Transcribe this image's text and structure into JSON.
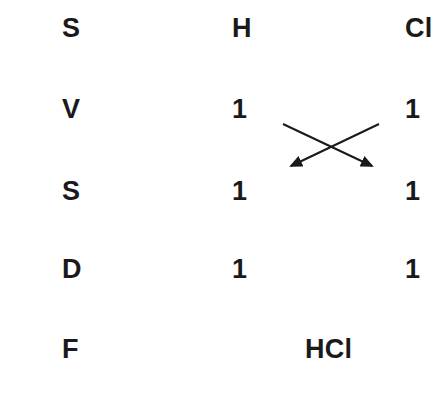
{
  "diagram": {
    "background_color": "#ffffff",
    "text_color": "#1a1a1a",
    "rows": [
      {
        "key": "symbol",
        "label": "S",
        "first": "H",
        "second": "Cl"
      },
      {
        "key": "valency",
        "label": "V",
        "first": "1",
        "second": "1"
      },
      {
        "key": "swap",
        "label": "S",
        "first": "1",
        "second": "1"
      },
      {
        "key": "divide",
        "label": "D",
        "first": "1",
        "second": "1"
      },
      {
        "key": "formula",
        "label": "F",
        "result": "HCl"
      }
    ],
    "arrows": {
      "name": "criss-cross-swap-arrows",
      "color": "#1a1a1a",
      "stroke_width": 2,
      "down_right": {
        "x1": 283,
        "y1": 124,
        "x2": 372,
        "y2": 166
      },
      "down_left": {
        "x1": 379,
        "y1": 124,
        "x2": 291,
        "y2": 166
      }
    }
  }
}
